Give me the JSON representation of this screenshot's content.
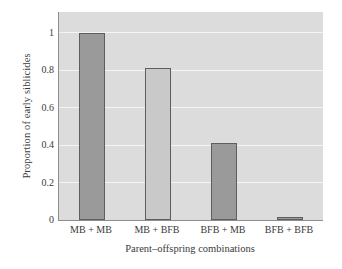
{
  "chart_data": {
    "type": "bar",
    "title": "",
    "categories": [
      "MB + MB",
      "MB + BFB",
      "BFB + MB",
      "BFB + BFB"
    ],
    "values": [
      1.0,
      0.81,
      0.41,
      0.015
    ],
    "xlabel": "Parent–offspring combinations",
    "ylabel": "Proportion of early siblicides",
    "ylim": [
      0,
      1.11
    ],
    "yticks": [
      0,
      0.2,
      0.4,
      0.6,
      0.8,
      1
    ],
    "ytick_labels": [
      "0",
      "0.2",
      "0.4",
      "0.6",
      "0.8",
      "1"
    ],
    "grid": true,
    "grid_color": "#f4f4f4",
    "legend": null,
    "panel_background": "#dcdcdc",
    "bar_colors": [
      "#9a9a9a",
      "#c9c9c9",
      "#9a9a9a",
      "#9a9a9a"
    ],
    "bar_edge_color": "#5e5e5e",
    "axis_color": "#8e8e8e",
    "text_color": "#3a3a3a",
    "figure_background": "#ffffff"
  }
}
